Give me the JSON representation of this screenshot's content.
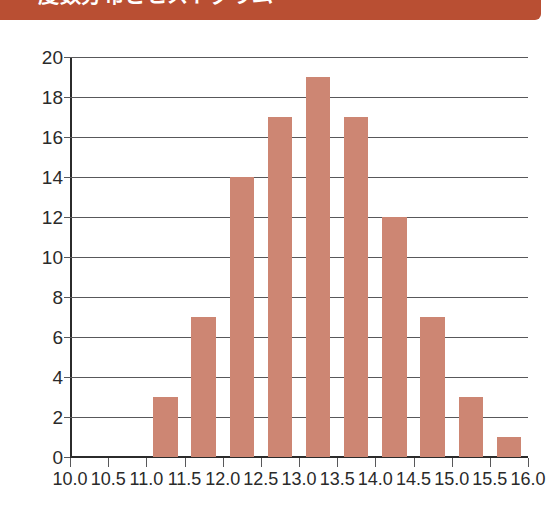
{
  "banner": {
    "title": "度数分布とヒストグラム",
    "color": "#b94f33",
    "text_color": "#ffffff"
  },
  "chart_data": {
    "type": "bar",
    "title": "度数分布とヒストグラム",
    "xlabel": "",
    "ylabel": "",
    "grid": true,
    "legend": null,
    "bar_color": "#cd8673",
    "axis_color": "#2b2b2b",
    "gridline_color": "#58585a",
    "xlim": [
      10.0,
      16.0
    ],
    "ylim": [
      0,
      20
    ],
    "x_tick_labels": [
      "10.0",
      "10.5",
      "11.0",
      "11.5",
      "12.0",
      "12.5",
      "13.0",
      "13.5",
      "14.0",
      "14.5",
      "15.0",
      "15.5",
      "16.0"
    ],
    "x_tick_values": [
      10.0,
      10.5,
      11.0,
      11.5,
      12.0,
      12.5,
      13.0,
      13.5,
      14.0,
      14.5,
      15.0,
      15.5,
      16.0
    ],
    "y_tick_labels": [
      "0",
      "2",
      "4",
      "6",
      "8",
      "10",
      "12",
      "14",
      "16",
      "18",
      "20"
    ],
    "y_tick_values": [
      0,
      2,
      4,
      6,
      8,
      10,
      12,
      14,
      16,
      18,
      20
    ],
    "bin_width": 0.5,
    "categories": [
      "10.0-10.5",
      "10.5-11.0",
      "11.0-11.5",
      "11.5-12.0",
      "12.0-12.5",
      "12.5-13.0",
      "13.0-13.5",
      "13.5-14.0",
      "14.0-14.5",
      "14.5-15.0",
      "15.0-15.5",
      "15.5-16.0"
    ],
    "bin_starts": [
      10.0,
      10.5,
      11.0,
      11.5,
      12.0,
      12.5,
      13.0,
      13.5,
      14.0,
      14.5,
      15.0,
      15.5
    ],
    "values": [
      0,
      0,
      3,
      7,
      14,
      17,
      19,
      17,
      12,
      7,
      3,
      1
    ]
  }
}
